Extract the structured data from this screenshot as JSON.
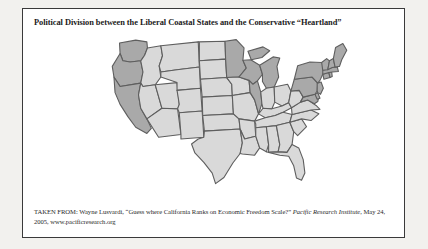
{
  "figure": {
    "title": "Political Division between the Liberal Coastal States and the Conservative “Heartland”",
    "caption": {
      "prefix": "TAKEN FROM: Wayne Lusvardi, “Guess where California Ranks on Economic Freedom Scale?” ",
      "publication": "Pacific Research Institute",
      "suffix": ", May 24, 2005, www.pacificresearch.org"
    }
  },
  "colors": {
    "liberal_fill": "#a9a9a9",
    "conservative_fill": "#d9d9d9",
    "state_border": "#5e5e5e",
    "frame_border": "#3a3a3a",
    "page_background": "#f2f1ee",
    "figure_background": "#ffffff"
  },
  "map": {
    "type": "choropleth",
    "region": "United States (contiguous 48 states)",
    "categories": [
      {
        "key": "liberal_coastal",
        "label": "Liberal Coastal States",
        "fill": "#a9a9a9"
      },
      {
        "key": "conservative_heartland",
        "label": "Conservative “Heartland”",
        "fill": "#d9d9d9"
      }
    ],
    "states": [
      {
        "code": "WA",
        "name": "Washington",
        "category": "liberal_coastal"
      },
      {
        "code": "OR",
        "name": "Oregon",
        "category": "liberal_coastal"
      },
      {
        "code": "CA",
        "name": "California",
        "category": "liberal_coastal"
      },
      {
        "code": "ID",
        "name": "Idaho",
        "category": "conservative_heartland"
      },
      {
        "code": "NV",
        "name": "Nevada",
        "category": "conservative_heartland"
      },
      {
        "code": "UT",
        "name": "Utah",
        "category": "conservative_heartland"
      },
      {
        "code": "AZ",
        "name": "Arizona",
        "category": "conservative_heartland"
      },
      {
        "code": "MT",
        "name": "Montana",
        "category": "conservative_heartland"
      },
      {
        "code": "WY",
        "name": "Wyoming",
        "category": "conservative_heartland"
      },
      {
        "code": "CO",
        "name": "Colorado",
        "category": "conservative_heartland"
      },
      {
        "code": "NM",
        "name": "New Mexico",
        "category": "conservative_heartland"
      },
      {
        "code": "ND",
        "name": "North Dakota",
        "category": "conservative_heartland"
      },
      {
        "code": "SD",
        "name": "South Dakota",
        "category": "conservative_heartland"
      },
      {
        "code": "NE",
        "name": "Nebraska",
        "category": "conservative_heartland"
      },
      {
        "code": "KS",
        "name": "Kansas",
        "category": "conservative_heartland"
      },
      {
        "code": "OK",
        "name": "Oklahoma",
        "category": "conservative_heartland"
      },
      {
        "code": "TX",
        "name": "Texas",
        "category": "conservative_heartland"
      },
      {
        "code": "MN",
        "name": "Minnesota",
        "category": "liberal_coastal"
      },
      {
        "code": "IA",
        "name": "Iowa",
        "category": "conservative_heartland"
      },
      {
        "code": "MO",
        "name": "Missouri",
        "category": "conservative_heartland"
      },
      {
        "code": "AR",
        "name": "Arkansas",
        "category": "conservative_heartland"
      },
      {
        "code": "LA",
        "name": "Louisiana",
        "category": "conservative_heartland"
      },
      {
        "code": "WI",
        "name": "Wisconsin",
        "category": "liberal_coastal"
      },
      {
        "code": "IL",
        "name": "Illinois",
        "category": "liberal_coastal"
      },
      {
        "code": "MI",
        "name": "Michigan",
        "category": "liberal_coastal"
      },
      {
        "code": "IN",
        "name": "Indiana",
        "category": "conservative_heartland"
      },
      {
        "code": "OH",
        "name": "Ohio",
        "category": "conservative_heartland"
      },
      {
        "code": "KY",
        "name": "Kentucky",
        "category": "conservative_heartland"
      },
      {
        "code": "TN",
        "name": "Tennessee",
        "category": "conservative_heartland"
      },
      {
        "code": "MS",
        "name": "Mississippi",
        "category": "conservative_heartland"
      },
      {
        "code": "AL",
        "name": "Alabama",
        "category": "conservative_heartland"
      },
      {
        "code": "GA",
        "name": "Georgia",
        "category": "conservative_heartland"
      },
      {
        "code": "FL",
        "name": "Florida",
        "category": "conservative_heartland"
      },
      {
        "code": "SC",
        "name": "South Carolina",
        "category": "conservative_heartland"
      },
      {
        "code": "NC",
        "name": "North Carolina",
        "category": "conservative_heartland"
      },
      {
        "code": "VA",
        "name": "Virginia",
        "category": "conservative_heartland"
      },
      {
        "code": "WV",
        "name": "West Virginia",
        "category": "conservative_heartland"
      },
      {
        "code": "MD",
        "name": "Maryland",
        "category": "liberal_coastal"
      },
      {
        "code": "DE",
        "name": "Delaware",
        "category": "liberal_coastal"
      },
      {
        "code": "PA",
        "name": "Pennsylvania",
        "category": "liberal_coastal"
      },
      {
        "code": "NJ",
        "name": "New Jersey",
        "category": "liberal_coastal"
      },
      {
        "code": "NY",
        "name": "New York",
        "category": "liberal_coastal"
      },
      {
        "code": "CT",
        "name": "Connecticut",
        "category": "liberal_coastal"
      },
      {
        "code": "RI",
        "name": "Rhode Island",
        "category": "liberal_coastal"
      },
      {
        "code": "MA",
        "name": "Massachusetts",
        "category": "liberal_coastal"
      },
      {
        "code": "VT",
        "name": "Vermont",
        "category": "liberal_coastal"
      },
      {
        "code": "NH",
        "name": "New Hampshire",
        "category": "liberal_coastal"
      },
      {
        "code": "ME",
        "name": "Maine",
        "category": "liberal_coastal"
      }
    ]
  }
}
